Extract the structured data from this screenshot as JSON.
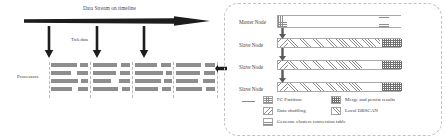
{
  "figure": {
    "left_panel": {
      "stream_title": "Data Stream on timeline",
      "tick_label": "Tick data",
      "processors_label": "Processors",
      "tick_arrow_count": 3,
      "processor_rows": 4,
      "processor_columns": 4
    },
    "right_panel": {
      "nodes": [
        {
          "label": "Master Node",
          "type": "master"
        },
        {
          "label": "Slave Node",
          "type": "slave"
        },
        {
          "label": "Slave Node",
          "type": "slave"
        },
        {
          "label": "Slave Node",
          "type": "slave"
        }
      ]
    },
    "legend": {
      "items": [
        {
          "key": "fc-partition",
          "label": "FC Partition",
          "pattern": "grid"
        },
        {
          "key": "merge-persist",
          "label": "Merge and persist results",
          "pattern": "dotted-grid"
        },
        {
          "key": "data-shuffling",
          "label": "Data shuffling",
          "pattern": "backslash-hatch"
        },
        {
          "key": "local-dbscan",
          "label": "Local DBSCAN",
          "pattern": "forwardslash-hatch"
        },
        {
          "key": "clusters-table",
          "label": "Generate clusters conversion table",
          "pattern": "horizontal-lines"
        }
      ]
    },
    "colors": {
      "line": "#8d8d8d",
      "text": "#3d3d3d",
      "processor_bar": "#8e8e8e",
      "panel_border": "#c2c2c2",
      "arrow": "#1d1d1d"
    }
  }
}
